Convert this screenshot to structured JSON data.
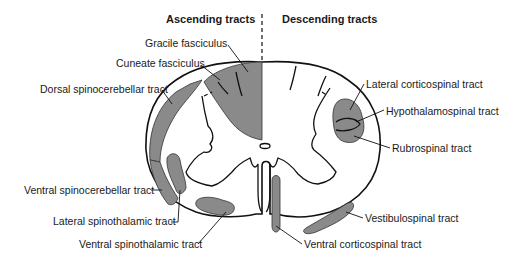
{
  "headers": {
    "ascending": "Ascending tracts",
    "descending": "Descending tracts"
  },
  "labels": {
    "gracile_fasciculus": "Gracile fasciculus",
    "cuneate_fasciculus": "Cuneate fasciculus",
    "dorsal_spinocerebellar": "Dorsal spinocerebellar tract",
    "ventral_spinocerebellar": "Ventral spinocerebellar tract",
    "lateral_spinothalamic": "Lateral spinothalamic tract",
    "ventral_spinothalamic": "Ventral spinothalamic tract",
    "lateral_corticospinal": "Lateral corticospinal tract",
    "hypothalamospinal": "Hypothalamospinal tract",
    "rubrospinal": "Rubrospinal tract",
    "vestibulospinal": "Vestibulospinal tract",
    "ventral_corticospinal": "Ventral corticospinal tract"
  },
  "colors": {
    "tract_fill": "#8a8a8a",
    "outline": "#111111",
    "background": "#ffffff"
  }
}
